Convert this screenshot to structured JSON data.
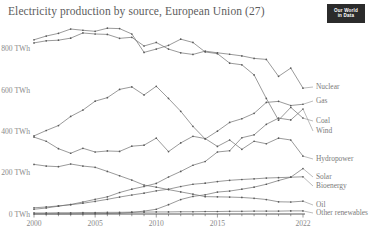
{
  "header": {
    "title": "Electricity production by source, European Union (27)",
    "logo_line1": "Our World",
    "logo_line2": "in Data"
  },
  "chart_data": {
    "type": "line",
    "title": "Electricity production by source, European Union (27)",
    "xlabel": "",
    "ylabel": "",
    "unit": "TWh",
    "grid": false,
    "legend_position": "right",
    "xlim": [
      2000,
      2022
    ],
    "ylim": [
      0,
      900
    ],
    "ytick_labels": [
      "0 TWh",
      "200 TWh",
      "400 TWh",
      "600 TWh",
      "800 TWh"
    ],
    "ytick_values": [
      0,
      200,
      400,
      600,
      800
    ],
    "xtick_labels": [
      "2000",
      "2005",
      "2010",
      "2015",
      "2022"
    ],
    "xtick_values": [
      2000,
      2005,
      2010,
      2015,
      2022
    ],
    "x": [
      2000,
      2001,
      2002,
      2003,
      2004,
      2005,
      2006,
      2007,
      2008,
      2009,
      2010,
      2011,
      2012,
      2013,
      2014,
      2015,
      2016,
      2017,
      2018,
      2019,
      2020,
      2021,
      2022
    ],
    "series": [
      {
        "name": "Coal",
        "values": [
          843,
          861,
          874,
          895,
          889,
          884,
          899,
          897,
          871,
          782,
          798,
          816,
          846,
          830,
          784,
          776,
          730,
          722,
          673,
          559,
          454,
          516,
          464
        ]
      },
      {
        "name": "Nuclear",
        "values": [
          828,
          838,
          841,
          851,
          876,
          871,
          869,
          850,
          855,
          813,
          830,
          798,
          780,
          772,
          788,
          780,
          773,
          765,
          753,
          748,
          666,
          706,
          609
        ]
      },
      {
        "name": "Gas",
        "values": [
          378,
          404,
          428,
          472,
          503,
          546,
          563,
          603,
          615,
          576,
          618,
          559,
          497,
          424,
          363,
          401,
          443,
          461,
          487,
          540,
          545,
          525,
          531
        ]
      },
      {
        "name": "Hydropower",
        "values": [
          372,
          352,
          316,
          294,
          318,
          300,
          305,
          303,
          328,
          333,
          367,
          302,
          344,
          376,
          365,
          327,
          358,
          313,
          352,
          340,
          367,
          358,
          280
        ]
      },
      {
        "name": "Wind",
        "values": [
          23,
          29,
          38,
          46,
          58,
          71,
          83,
          104,
          120,
          133,
          148,
          179,
          206,
          236,
          254,
          300,
          306,
          369,
          383,
          434,
          464,
          455,
          508
        ]
      },
      {
        "name": "Solar",
        "values": [
          0.1,
          0.2,
          0.3,
          0.5,
          0.8,
          1.5,
          2.5,
          3.8,
          7.5,
          14,
          23,
          45,
          70,
          85,
          93,
          106,
          111,
          120,
          130,
          144,
          162,
          178,
          220
        ]
      },
      {
        "name": "Bioenergy",
        "values": [
          30,
          34,
          39,
          45,
          52,
          61,
          71,
          82,
          92,
          101,
          112,
          120,
          133,
          144,
          149,
          157,
          163,
          167,
          170,
          174,
          176,
          178,
          180
        ]
      },
      {
        "name": "Oil",
        "values": [
          240,
          232,
          229,
          242,
          232,
          226,
          206,
          185,
          164,
          140,
          130,
          118,
          107,
          96,
          84,
          83,
          82,
          80,
          76,
          70,
          59,
          58,
          62
        ]
      },
      {
        "name": "Other renewables",
        "values": [
          5,
          5,
          6,
          6,
          7,
          7,
          8,
          8,
          9,
          9,
          10,
          10,
          11,
          11,
          12,
          12,
          13,
          13,
          14,
          14,
          14,
          15,
          15
        ]
      }
    ]
  },
  "legend": {
    "items": [
      {
        "label": "Nuclear"
      },
      {
        "label": "Gas"
      },
      {
        "label": "Coal"
      },
      {
        "label": "Wind"
      },
      {
        "label": "Hydropower"
      },
      {
        "label": "Solar"
      },
      {
        "label": "Bioenergy"
      },
      {
        "label": "Oil"
      },
      {
        "label": "Other renewables"
      }
    ]
  }
}
